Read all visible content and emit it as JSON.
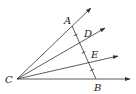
{
  "diagram": {
    "type": "geometry",
    "colors": {
      "stroke": "#333333",
      "background": "#ffffff"
    },
    "points": {
      "C": {
        "label": "C",
        "x": 17,
        "y": 79
      },
      "A": {
        "label": "A",
        "x": 72,
        "y": 26
      },
      "D": {
        "label": "D",
        "x": 79,
        "y": 44
      },
      "E": {
        "label": "E",
        "x": 88,
        "y": 61
      },
      "B": {
        "label": "B",
        "x": 96,
        "y": 79
      }
    },
    "rays": [
      {
        "name": "CA",
        "from": "C",
        "to": [
          91,
          8
        ]
      },
      {
        "name": "CD",
        "from": "C",
        "to": [
          105,
          28
        ]
      },
      {
        "name": "CE",
        "from": "C",
        "to": [
          118,
          56
        ]
      },
      {
        "name": "CB",
        "from": "C",
        "to": [
          130,
          79
        ]
      }
    ],
    "segments": [
      {
        "name": "AB",
        "from": "A",
        "to": "B"
      }
    ],
    "tick_marks": [
      [
        75.5,
        35
      ],
      [
        83.5,
        52.5
      ],
      [
        92,
        70
      ]
    ]
  }
}
